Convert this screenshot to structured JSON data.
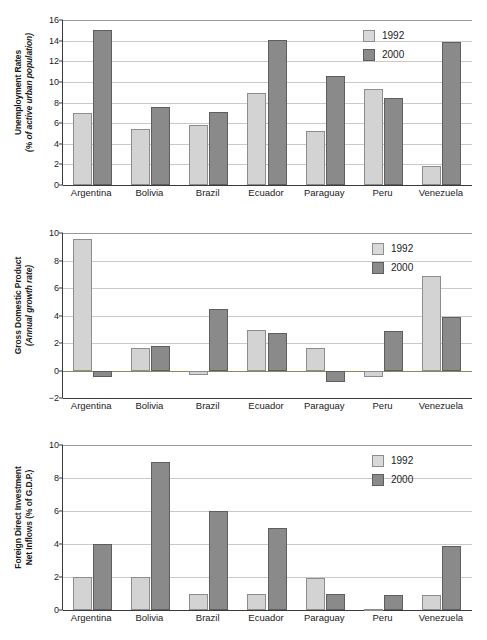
{
  "legend": {
    "entries": [
      {
        "label": "1992",
        "color": "#d3d3d3"
      },
      {
        "label": "2000",
        "color": "#8a8a8a"
      }
    ]
  },
  "categories": [
    "Argentina",
    "Bolivia",
    "Brazil",
    "Ecuador",
    "Paraguay",
    "Peru",
    "Venezuela"
  ],
  "charts": [
    {
      "id": "unemployment",
      "ylabel_line1": "Unemployment Rates",
      "ylabel_line2": "(% of active urban population)",
      "yticks": [
        "0",
        "2",
        "4",
        "6",
        "8",
        "10",
        "12",
        "14",
        "16"
      ]
    },
    {
      "id": "gdp",
      "ylabel_line1": "Gross Domestic Product",
      "ylabel_line2": "(Annual growth rate)",
      "yticks": [
        "−2",
        "0",
        "2",
        "4",
        "6",
        "8",
        "10"
      ]
    },
    {
      "id": "fdi",
      "ylabel_line1": "Foreign Direct Investment",
      "ylabel_line2": "Net Inflows (% of G.D.P.)",
      "yticks": [
        "0",
        "2",
        "4",
        "6",
        "8",
        "10"
      ]
    }
  ],
  "chart_data": [
    {
      "type": "bar",
      "title": "Unemployment Rates (% of active urban population)",
      "xlabel": "",
      "ylabel": "Unemployment Rates (% of active urban population)",
      "categories": [
        "Argentina",
        "Bolivia",
        "Brazil",
        "Ecuador",
        "Paraguay",
        "Peru",
        "Venezuela"
      ],
      "series": [
        {
          "name": "1992",
          "values": [
            7.0,
            5.4,
            5.8,
            8.9,
            5.2,
            9.3,
            1.8
          ]
        },
        {
          "name": "2000",
          "values": [
            15.0,
            7.6,
            7.1,
            14.1,
            10.6,
            8.4,
            13.9
          ]
        }
      ],
      "ylim": [
        0,
        16
      ],
      "ytick_step": 2,
      "grid": true,
      "legend_position": "top-right"
    },
    {
      "type": "bar",
      "title": "Gross Domestic Product (Annual growth rate)",
      "xlabel": "",
      "ylabel": "Gross Domestic Product (Annual growth rate)",
      "categories": [
        "Argentina",
        "Bolivia",
        "Brazil",
        "Ecuador",
        "Paraguay",
        "Peru",
        "Venezuela"
      ],
      "series": [
        {
          "name": "1992",
          "values": [
            9.6,
            1.65,
            -0.35,
            2.95,
            1.65,
            -0.5,
            6.9
          ]
        },
        {
          "name": "2000",
          "values": [
            -0.5,
            1.75,
            4.45,
            2.75,
            -0.8,
            2.9,
            3.9
          ]
        }
      ],
      "ylim": [
        -2,
        10
      ],
      "ytick_step": 2,
      "grid": true,
      "legend_position": "top-right"
    },
    {
      "type": "bar",
      "title": "Foreign Direct Investment Net Inflows (% of G.D.P.)",
      "xlabel": "",
      "ylabel": "Foreign Direct Investment Net Inflows (% of G.D.P.)",
      "categories": [
        "Argentina",
        "Bolivia",
        "Brazil",
        "Ecuador",
        "Paraguay",
        "Peru",
        "Venezuela"
      ],
      "series": [
        {
          "name": "1992",
          "values": [
            2.0,
            2.0,
            1.0,
            1.0,
            1.95,
            0.05,
            0.9
          ]
        },
        {
          "name": "2000",
          "values": [
            4.0,
            9.0,
            6.0,
            5.0,
            0.95,
            0.9,
            3.9
          ]
        }
      ],
      "ylim": [
        0,
        10
      ],
      "ytick_step": 2,
      "grid": true,
      "legend_position": "top-right"
    }
  ]
}
